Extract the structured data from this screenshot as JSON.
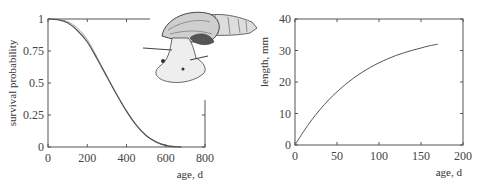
{
  "chart_data": [
    {
      "type": "line",
      "title": "",
      "xlabel": "age, d",
      "ylabel": "survival probability",
      "xlim": [
        0,
        800
      ],
      "ylim": [
        0,
        1
      ],
      "xticks": [
        "0",
        "200",
        "400",
        "600",
        "800"
      ],
      "yticks": [
        "0",
        "0.25",
        "0.5",
        "0.75",
        "1"
      ],
      "grid": false,
      "series": [
        {
          "name": "model fit",
          "x": [
            0,
            50,
            100,
            150,
            200,
            250,
            300,
            350,
            400,
            450,
            500,
            550,
            600,
            650,
            680
          ],
          "y": [
            1.0,
            0.995,
            0.97,
            0.91,
            0.82,
            0.69,
            0.55,
            0.41,
            0.28,
            0.17,
            0.09,
            0.04,
            0.012,
            0.002,
            0.0
          ]
        },
        {
          "name": "data",
          "x": [
            0,
            50,
            100,
            150,
            200,
            250,
            300,
            350,
            400,
            450,
            500,
            550,
            600,
            650,
            680
          ],
          "y": [
            1.0,
            1.0,
            0.98,
            0.93,
            0.84,
            0.7,
            0.55,
            0.41,
            0.28,
            0.17,
            0.09,
            0.04,
            0.012,
            0.003,
            0.0
          ]
        }
      ]
    },
    {
      "type": "line",
      "title": "",
      "xlabel": "age, d",
      "ylabel": "length, mm",
      "xlim": [
        0,
        200
      ],
      "ylim": [
        0,
        40
      ],
      "xticks": [
        "0",
        "50",
        "100",
        "150",
        "200"
      ],
      "yticks": [
        "0",
        "10",
        "20",
        "30",
        "40"
      ],
      "grid": false,
      "series": [
        {
          "name": "growth curve",
          "x": [
            0,
            10,
            20,
            30,
            40,
            50,
            60,
            70,
            80,
            90,
            100,
            110,
            120,
            130,
            140,
            150,
            160,
            170
          ],
          "y": [
            0,
            4.2,
            8.0,
            11.3,
            14.3,
            16.9,
            19.2,
            21.3,
            23.1,
            24.7,
            26.1,
            27.3,
            28.4,
            29.3,
            30.1,
            30.8,
            31.5,
            32.0
          ]
        }
      ]
    }
  ],
  "illustration": {
    "name": "snail-illustration",
    "description": "pen drawing of a snail with high-spired shell"
  }
}
